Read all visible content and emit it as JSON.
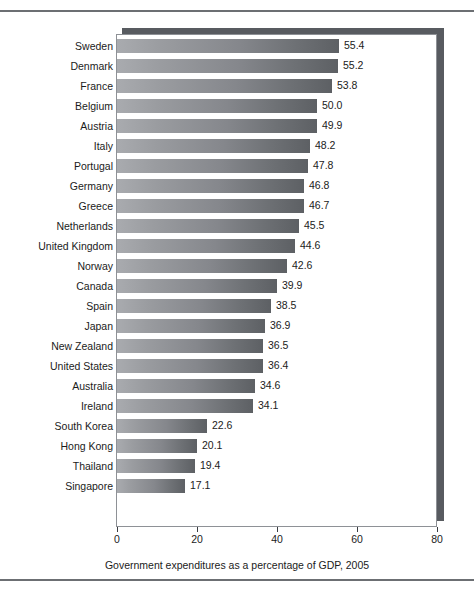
{
  "figure": {
    "name": "government-expenditures-bar-chart",
    "background_color": "#ffffff",
    "rule_color": "#6c6f73",
    "frame_border_color": "#8e9196",
    "shadow_color": "#585b60",
    "bar_color_light": "#a9abaf",
    "bar_color_dark": "#5d6064",
    "text_color": "#1b1b1b"
  },
  "chart_data": {
    "type": "bar",
    "orientation": "horizontal",
    "title": "",
    "subtitle": "",
    "xlabel": "Government expenditures as a percentage of GDP, 2005",
    "ylabel": "",
    "xlim": [
      0,
      80
    ],
    "ylim": [],
    "xticks": [
      "0",
      "20",
      "40",
      "60",
      "80"
    ],
    "xtick_values": [
      0,
      20,
      40,
      60,
      80
    ],
    "grid": false,
    "legend": false,
    "legend_position": "none",
    "data_labels": true,
    "categories": [
      "Sweden",
      "Denmark",
      "France",
      "Belgium",
      "Austria",
      "Italy",
      "Portugal",
      "Germany",
      "Greece",
      "Netherlands",
      "United Kingdom",
      "Norway",
      "Canada",
      "Spain",
      "Japan",
      "New Zealand",
      "United States",
      "Australia",
      "Ireland",
      "South Korea",
      "Hong Kong",
      "Thailand",
      "Singapore"
    ],
    "values": [
      55.4,
      55.2,
      53.8,
      50.0,
      49.9,
      48.2,
      47.8,
      46.8,
      46.7,
      45.5,
      44.6,
      42.6,
      39.9,
      38.5,
      36.9,
      36.5,
      36.4,
      34.6,
      34.1,
      22.6,
      20.1,
      19.4,
      17.1
    ],
    "value_labels": [
      "55.4",
      "55.2",
      "53.8",
      "50.0",
      "49.9",
      "48.2",
      "47.8",
      "46.8",
      "46.7",
      "45.5",
      "44.6",
      "42.6",
      "39.9",
      "38.5",
      "36.9",
      "36.5",
      "36.4",
      "34.6",
      "34.1",
      "22.6",
      "20.1",
      "19.4",
      "17.1"
    ]
  }
}
